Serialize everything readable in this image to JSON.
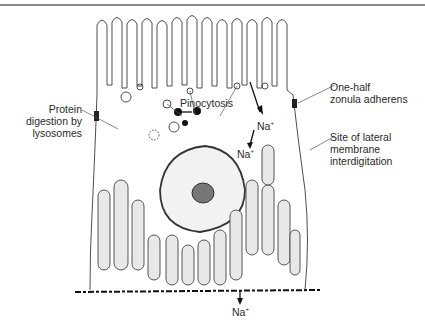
{
  "figure": {
    "labels": {
      "pinocytosis": "Pinocytosis",
      "na_apical": "Na",
      "na_middle": "Na",
      "na_basal": "Na",
      "na_superscript": "+",
      "protein_digestion_line1": "Protein",
      "protein_digestion_line2": "digestion by",
      "protein_digestion_line3": "lysosomes",
      "zonula_line1": "One-half",
      "zonula_line2": "zonula adherens",
      "lateral_line1": "Site of lateral",
      "lateral_line2": "membrane",
      "lateral_line3": "interdigitation"
    },
    "colors": {
      "ink": "#2a2a2a",
      "rule": "#8a8a8a",
      "background": "#ffffff"
    }
  }
}
